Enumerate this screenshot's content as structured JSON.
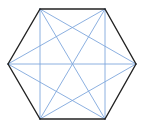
{
  "diagram": {
    "type": "complete-graph-on-hexagon",
    "vertices": [
      {
        "id": "A",
        "x": 40,
        "y": 9
      },
      {
        "id": "B",
        "x": 105,
        "y": 9
      },
      {
        "id": "C",
        "x": 136,
        "y": 64
      },
      {
        "id": "D",
        "x": 105,
        "y": 119
      },
      {
        "id": "E",
        "x": 40,
        "y": 119
      },
      {
        "id": "F",
        "x": 8,
        "y": 64
      }
    ],
    "edges": [
      {
        "from": "A",
        "to": "B"
      },
      {
        "from": "B",
        "to": "C"
      },
      {
        "from": "C",
        "to": "D"
      },
      {
        "from": "D",
        "to": "E"
      },
      {
        "from": "E",
        "to": "F"
      },
      {
        "from": "F",
        "to": "A"
      }
    ],
    "diagonals": [
      {
        "from": "A",
        "to": "C"
      },
      {
        "from": "A",
        "to": "D"
      },
      {
        "from": "A",
        "to": "E"
      },
      {
        "from": "B",
        "to": "D"
      },
      {
        "from": "B",
        "to": "E"
      },
      {
        "from": "B",
        "to": "F"
      },
      {
        "from": "C",
        "to": "E"
      },
      {
        "from": "C",
        "to": "F"
      },
      {
        "from": "D",
        "to": "F"
      }
    ],
    "colors": {
      "outline": "#222222",
      "diagonal": "#7fa7dd",
      "background": "#ffffff"
    }
  }
}
